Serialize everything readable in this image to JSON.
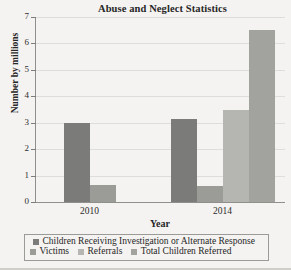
{
  "chart_data": {
    "type": "bar",
    "title": "Abuse and Neglect Statistics",
    "xlabel": "Year",
    "ylabel": "Number by millions",
    "categories": [
      "2010",
      "2014"
    ],
    "ylim": [
      0,
      7
    ],
    "yticks": [
      "0",
      "1",
      "2",
      "3",
      "4",
      "5",
      "6",
      "7"
    ],
    "grid": true,
    "legend_position": "bottom",
    "series": [
      {
        "name": "Children Receiving Investigation or Alternate Response",
        "color": "#7b7b79",
        "values": [
          3.0,
          3.15
        ]
      },
      {
        "name": "Victims",
        "color": "#9b9b98",
        "values": [
          0.65,
          0.6
        ]
      },
      {
        "name": "Referrals",
        "color": "#b5b5b1",
        "values": [
          null,
          3.5
        ]
      },
      {
        "name": "Total Children Referred",
        "color": "#a2a29e",
        "values": [
          null,
          6.5
        ]
      }
    ]
  },
  "legend": {
    "row1": [
      {
        "label": "Children Receiving Investigation or Alternate Response",
        "color": "#7b7b79"
      }
    ],
    "row2": [
      {
        "label": "Victims",
        "color": "#9b9b98"
      },
      {
        "label": "Referrals",
        "color": "#b5b5b1"
      },
      {
        "label": "Total Children Referred",
        "color": "#a2a29e"
      }
    ]
  }
}
